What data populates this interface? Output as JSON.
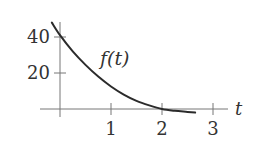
{
  "chart_data": {
    "type": "line",
    "title": "",
    "xlabel": "t",
    "ylabel": "",
    "function_label": "f(t)",
    "xlim": [
      -0.15,
      3.3
    ],
    "ylim": [
      -5,
      46
    ],
    "x_ticks": [
      1,
      2,
      3
    ],
    "x_tick_labels": [
      "1",
      "2",
      "3"
    ],
    "y_ticks": [
      20,
      40
    ],
    "y_tick_labels": [
      "20",
      "40"
    ],
    "grid": false,
    "legend": null,
    "series": [
      {
        "name": "f(t)",
        "x": [
          -0.16,
          0,
          0.25,
          0.5,
          0.75,
          1.0,
          1.25,
          1.5,
          1.75,
          2.0,
          2.25,
          2.5,
          2.65
        ],
        "values": [
          48,
          41,
          32,
          24.5,
          18,
          12.5,
          8,
          4.5,
          2,
          0,
          -1,
          -1.6,
          -2
        ]
      }
    ],
    "colors": {
      "curve": "#2b2b2b",
      "axis": "#777777",
      "text": "#333333"
    }
  }
}
